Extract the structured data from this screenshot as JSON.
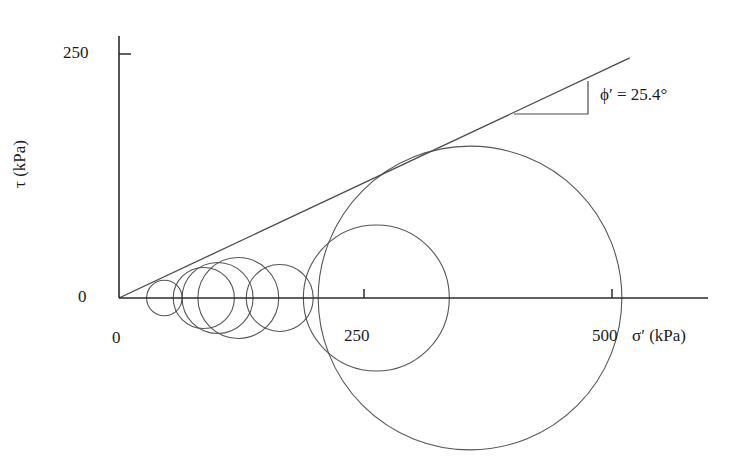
{
  "figure": {
    "type": "mohr-circle-diagram"
  },
  "axes": {
    "y": {
      "label": "τ (kPa)",
      "ticks": [
        "0",
        "250"
      ],
      "tick_values": [
        0,
        250
      ],
      "origin_px": [
        119,
        298
      ],
      "scale_px_per_kpa": 0.976,
      "range": [
        0,
        260
      ]
    },
    "x": {
      "label": "σ′ (kPa)",
      "ticks": [
        "0",
        "250",
        "500"
      ],
      "tick_values": [
        0,
        250,
        500
      ],
      "scale_px_per_kpa": 0.986,
      "range": [
        0,
        600
      ]
    }
  },
  "annotation": {
    "phi_label": "ϕ′ = 25.4°",
    "phi_value": 25.4,
    "phi_symbol": "ϕ′",
    "triangle": {
      "x1": 514,
      "y1": 114,
      "x2": 588,
      "y2": 114,
      "x3": 588,
      "y3": 81
    }
  },
  "chart_data": {
    "type": "line",
    "title": "",
    "xlabel": "σ′ (kPa)",
    "ylabel": "τ (kPa)",
    "xlim": [
      0,
      600
    ],
    "ylim": [
      0,
      260
    ],
    "grid": false,
    "legend": null,
    "failure_envelope": {
      "name": "Failure envelope",
      "intercept_kpa": 0,
      "friction_angle_deg": 25.4,
      "slope": 0.4748,
      "x_start_kpa": 0,
      "x_end_kpa": 518,
      "y_start_kpa": 0,
      "y_end_kpa": 246
    },
    "mohr_circles": [
      {
        "id": 1,
        "sigma3_kpa": 28,
        "sigma1_kpa": 64,
        "center_kpa": 46,
        "radius_kpa": 18
      },
      {
        "id": 2,
        "sigma3_kpa": 55,
        "sigma1_kpa": 118,
        "center_kpa": 86,
        "radius_kpa": 31
      },
      {
        "id": 3,
        "sigma3_kpa": 65,
        "sigma1_kpa": 136,
        "center_kpa": 100,
        "radius_kpa": 36
      },
      {
        "id": 4,
        "sigma3_kpa": 80,
        "sigma1_kpa": 161,
        "center_kpa": 121,
        "radius_kpa": 41
      },
      {
        "id": 5,
        "sigma3_kpa": 129,
        "sigma1_kpa": 197,
        "center_kpa": 163,
        "radius_kpa": 34
      },
      {
        "id": 6,
        "sigma3_kpa": 187,
        "sigma1_kpa": 335,
        "center_kpa": 261,
        "radius_kpa": 74
      },
      {
        "id": 7,
        "sigma3_kpa": 202,
        "sigma1_kpa": 509,
        "center_kpa": 356,
        "radius_kpa": 154
      }
    ]
  },
  "style": {
    "line_color": "#4a4a4a",
    "axis_color": "#2b2b2b",
    "circle_color": "#555555",
    "text_color": "#1a1a1a",
    "background": "#ffffff"
  }
}
